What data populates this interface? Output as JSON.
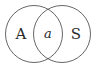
{
  "diagram": {
    "type": "venn",
    "stroke_color": "#555555",
    "text_color": "#2a2a2a",
    "sets": [
      {
        "id": "left",
        "label": "A"
      },
      {
        "id": "right",
        "label": "S"
      }
    ],
    "intersection": {
      "label": "a"
    }
  }
}
